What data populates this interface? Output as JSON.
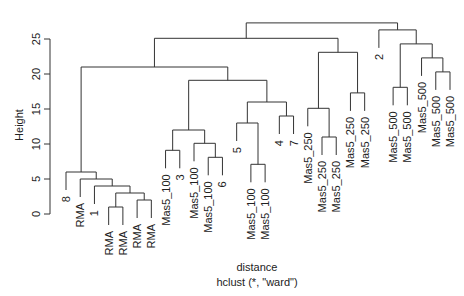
{
  "chart_data": {
    "type": "dendrogram",
    "title": "",
    "xlabel": "distance",
    "sub": "hclust (*, \"ward\")",
    "ylabel": "Height",
    "ylim": [
      0,
      27.5
    ],
    "yticks": [
      0,
      5,
      10,
      15,
      20,
      25
    ],
    "grid": false,
    "legend": null,
    "hang": 2.6,
    "leaves": [
      "8",
      "RMA",
      "1",
      "RMA",
      "RMA",
      "RMA",
      "RMA",
      "Mas5_100",
      "3",
      "Mas5_100",
      "Mas5_100",
      "6",
      "5",
      "Mas5_100",
      "Mas5_100",
      "4",
      "7",
      "Mas5_250",
      "Mas5_250",
      "Mas5_250",
      "Mas5_250",
      "Mas5_250",
      "2",
      "Mas5_500",
      "Mas5_500",
      "Mas5_500",
      "Mas5_500",
      "Mas5_500"
    ],
    "merges": [
      {
        "id": "A",
        "left": "L3",
        "right": "L4",
        "height": 1.0
      },
      {
        "id": "B",
        "left": "L5",
        "right": "L6",
        "height": 2.0
      },
      {
        "id": "C",
        "left": "A",
        "right": "B",
        "height": 3.0
      },
      {
        "id": "D",
        "left": "L2",
        "right": "C",
        "height": 4.0
      },
      {
        "id": "E",
        "left": "L1",
        "right": "D",
        "height": 5.0
      },
      {
        "id": "F",
        "left": "L0",
        "right": "E",
        "height": 6.0
      },
      {
        "id": "G",
        "left": "L7",
        "right": "L8",
        "height": 9.1
      },
      {
        "id": "H",
        "left": "L10",
        "right": "L11",
        "height": 8.1
      },
      {
        "id": "I",
        "left": "L9",
        "right": "H",
        "height": 10.1
      },
      {
        "id": "J",
        "left": "G",
        "right": "I",
        "height": 12.0
      },
      {
        "id": "K",
        "left": "L13",
        "right": "L14",
        "height": 7.1
      },
      {
        "id": "L",
        "left": "L12",
        "right": "K",
        "height": 13.0
      },
      {
        "id": "M",
        "left": "L15",
        "right": "L16",
        "height": 14.0
      },
      {
        "id": "N",
        "left": "L",
        "right": "M",
        "height": 16.0
      },
      {
        "id": "O",
        "left": "J",
        "right": "N",
        "height": 19.1
      },
      {
        "id": "P",
        "left": "F",
        "right": "O",
        "height": 21.0
      },
      {
        "id": "Q",
        "left": "L18",
        "right": "L19",
        "height": 11.0
      },
      {
        "id": "R",
        "left": "L17",
        "right": "Q",
        "height": 15.1
      },
      {
        "id": "S",
        "left": "L20",
        "right": "L21",
        "height": 17.3
      },
      {
        "id": "T",
        "left": "R",
        "right": "S",
        "height": 23.1
      },
      {
        "id": "U",
        "left": "P",
        "right": "T",
        "height": 25.1
      },
      {
        "id": "V",
        "left": "L23",
        "right": "L24",
        "height": 18.1
      },
      {
        "id": "W",
        "left": "L26",
        "right": "L27",
        "height": 20.3
      },
      {
        "id": "X",
        "left": "L25",
        "right": "W",
        "height": 22.3
      },
      {
        "id": "Y",
        "left": "V",
        "right": "X",
        "height": 24.3
      },
      {
        "id": "Z",
        "left": "L22",
        "right": "Y",
        "height": 26.3
      },
      {
        "id": "ROOT",
        "left": "U",
        "right": "Z",
        "height": 27.3
      }
    ]
  }
}
